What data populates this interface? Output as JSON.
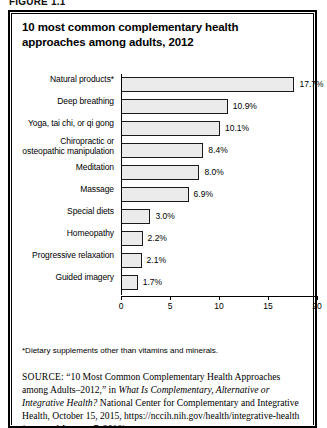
{
  "figure_number": "FIGURE 1.1",
  "title": "10 most common complementary health approaches among adults, 2012",
  "footnote": "*Dietary supplements other than vitamins and minerals.",
  "source": {
    "label": "SOURCE:",
    "part1": "“10 Most Common Complementary Health Approaches among Adults–2012,” in ",
    "italic1": "What Is Complementary, Alternative or Integrative Health?",
    "part2": " National Center for Complementary and Integrative Health, October 15, 2015, https://nccih.nih.gov/health/integrative-health (accessed January 7, 2016)"
  },
  "colors": {
    "bar_fill": "#ebebeb",
    "bar_border": "#1a1a1a",
    "frame": "#000000",
    "text": "#000000"
  },
  "chart_data": {
    "type": "bar",
    "orientation": "horizontal",
    "title": "10 most common complementary health approaches among adults, 2012",
    "xlabel": "",
    "ylabel": "",
    "xlim": [
      0,
      20
    ],
    "xticks": [
      "0",
      "5",
      "10",
      "15",
      "20"
    ],
    "grid": false,
    "legend": "none",
    "value_suffix": "%",
    "categories": [
      "Natural products*",
      "Deep breathing",
      "Yoga, tai chi, or qi gong",
      "Chiropractic or osteopathic manipulation",
      "Meditation",
      "Massage",
      "Special diets",
      "Homeopathy",
      "Progressive relaxation",
      "Guided imagery"
    ],
    "values": [
      17.7,
      10.9,
      10.1,
      8.4,
      8.0,
      6.9,
      3.0,
      2.2,
      2.1,
      1.7
    ],
    "labels": [
      "17.7%",
      "10.9%",
      "10.1%",
      "8.4%",
      "8.0%",
      "6.9%",
      "3.0%",
      "2.2%",
      "2.1%",
      "1.7%"
    ],
    "rows": [
      {
        "label_line1": "Natural products*",
        "label_line2": "",
        "value": 17.7,
        "label": "17.7%"
      },
      {
        "label_line1": "Deep breathing",
        "label_line2": "",
        "value": 10.9,
        "label": "10.9%"
      },
      {
        "label_line1": "Yoga, tai chi, or qi gong",
        "label_line2": "",
        "value": 10.1,
        "label": "10.1%"
      },
      {
        "label_line1": "Chiropractic or",
        "label_line2": "osteopathic manipulation",
        "value": 8.4,
        "label": "8.4%"
      },
      {
        "label_line1": "Meditation",
        "label_line2": "",
        "value": 8.0,
        "label": "8.0%"
      },
      {
        "label_line1": "Massage",
        "label_line2": "",
        "value": 6.9,
        "label": "6.9%"
      },
      {
        "label_line1": "Special diets",
        "label_line2": "",
        "value": 3.0,
        "label": "3.0%"
      },
      {
        "label_line1": "Homeopathy",
        "label_line2": "",
        "value": 2.2,
        "label": "2.2%"
      },
      {
        "label_line1": "Progressive relaxation",
        "label_line2": "",
        "value": 2.1,
        "label": "2.1%"
      },
      {
        "label_line1": "Guided imagery",
        "label_line2": "",
        "value": 1.7,
        "label": "1.7%"
      }
    ]
  }
}
